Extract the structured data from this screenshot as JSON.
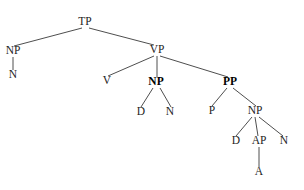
{
  "figure": {
    "type": "syntax-tree",
    "title": "",
    "background_color": "#ffffff",
    "line_color": "#3a3a3a",
    "text_color": "#1d1d1d"
  },
  "nodes": [
    {
      "id": "TP",
      "label": "TP",
      "x": 85,
      "y": 25,
      "bold": false
    },
    {
      "id": "NP_subj",
      "label": "NP",
      "x": 13,
      "y": 54,
      "bold": false
    },
    {
      "id": "N_subj",
      "label": "N",
      "x": 13,
      "y": 78,
      "bold": false
    },
    {
      "id": "VP",
      "label": "VP",
      "x": 157,
      "y": 53,
      "bold": false
    },
    {
      "id": "V",
      "label": "V",
      "x": 107,
      "y": 84,
      "bold": false
    },
    {
      "id": "NP_obj",
      "label": "NP",
      "x": 156,
      "y": 85,
      "bold": true
    },
    {
      "id": "D_obj",
      "label": "D",
      "x": 141,
      "y": 115,
      "bold": false
    },
    {
      "id": "N_obj",
      "label": "N",
      "x": 170,
      "y": 115,
      "bold": false
    },
    {
      "id": "PP",
      "label": "PP",
      "x": 230,
      "y": 85,
      "bold": true
    },
    {
      "id": "P",
      "label": "P",
      "x": 212,
      "y": 114,
      "bold": false
    },
    {
      "id": "NP_pp",
      "label": "NP",
      "x": 255,
      "y": 114,
      "bold": false
    },
    {
      "id": "D_pp",
      "label": "D",
      "x": 236,
      "y": 144,
      "bold": false
    },
    {
      "id": "AP",
      "label": "AP",
      "x": 259,
      "y": 144,
      "bold": false
    },
    {
      "id": "N_pp",
      "label": "N",
      "x": 284,
      "y": 144,
      "bold": false
    },
    {
      "id": "A",
      "label": "A",
      "x": 259,
      "y": 175,
      "bold": false
    }
  ],
  "edges": [
    {
      "from": "TP",
      "to": "NP_subj",
      "x1": 82,
      "y1": 28,
      "x2": 14,
      "y2": 46
    },
    {
      "from": "TP",
      "to": "VP",
      "x1": 89,
      "y1": 28,
      "x2": 154,
      "y2": 45
    },
    {
      "from": "NP_subj",
      "to": "N_subj",
      "x1": 13,
      "y1": 57,
      "x2": 13,
      "y2": 70
    },
    {
      "from": "VP",
      "to": "V",
      "x1": 154,
      "y1": 56,
      "x2": 108,
      "y2": 76
    },
    {
      "from": "VP",
      "to": "NP_obj",
      "x1": 157,
      "y1": 56,
      "x2": 157,
      "y2": 77
    },
    {
      "from": "VP",
      "to": "PP",
      "x1": 160,
      "y1": 56,
      "x2": 228,
      "y2": 77
    },
    {
      "from": "NP_obj",
      "to": "D_obj",
      "x1": 153,
      "y1": 88,
      "x2": 141,
      "y2": 107
    },
    {
      "from": "NP_obj",
      "to": "N_obj",
      "x1": 160,
      "y1": 88,
      "x2": 171,
      "y2": 107
    },
    {
      "from": "PP",
      "to": "P",
      "x1": 227,
      "y1": 88,
      "x2": 212,
      "y2": 106
    },
    {
      "from": "PP",
      "to": "NP_pp",
      "x1": 233,
      "y1": 88,
      "x2": 256,
      "y2": 106
    },
    {
      "from": "NP_pp",
      "to": "D_pp",
      "x1": 252,
      "y1": 117,
      "x2": 236,
      "y2": 136
    },
    {
      "from": "NP_pp",
      "to": "AP",
      "x1": 255,
      "y1": 117,
      "x2": 258,
      "y2": 136
    },
    {
      "from": "NP_pp",
      "to": "N_pp",
      "x1": 259,
      "y1": 117,
      "x2": 283,
      "y2": 136
    },
    {
      "from": "AP",
      "to": "A",
      "x1": 259,
      "y1": 147,
      "x2": 259,
      "y2": 167
    }
  ]
}
